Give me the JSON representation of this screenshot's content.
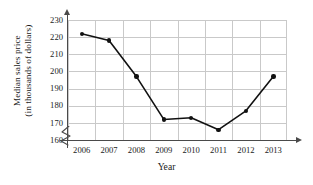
{
  "chart_data": {
    "type": "line",
    "title": "",
    "xlabel": "Year",
    "ylabel_line1": "Median sales price",
    "ylabel_line2": "(in thousands of dollars)",
    "categories": [
      "2006",
      "2007",
      "2008",
      "2009",
      "2010",
      "2011",
      "2012",
      "2013"
    ],
    "values": [
      222,
      218,
      197,
      172,
      173,
      166,
      177,
      197
    ],
    "series": [
      {
        "name": "Median sales price",
        "values": [
          222,
          218,
          197,
          172,
          173,
          166,
          177,
          197
        ]
      }
    ],
    "points": [
      {
        "x": "2006",
        "y": 222
      },
      {
        "x": "2007",
        "y": 218
      },
      {
        "x": "2008",
        "y": 197
      },
      {
        "x": "2009",
        "y": 172
      },
      {
        "x": "2010",
        "y": 173
      },
      {
        "x": "2011",
        "y": 166
      },
      {
        "x": "2012",
        "y": 177
      },
      {
        "x": "2013",
        "y": 197
      }
    ],
    "yticks": [
      230,
      220,
      210,
      200,
      190,
      180,
      170,
      160
    ],
    "ylim": [
      160,
      230
    ],
    "ytick_step": 10,
    "grid": true,
    "legend": "none",
    "axis_break": "y-axis broken below 160",
    "marker": "filled-circle",
    "line_color": "#111111",
    "grid_color": "#c9c9c9",
    "axis_color": "#4a4a4a",
    "background_color": "#ffffff"
  }
}
